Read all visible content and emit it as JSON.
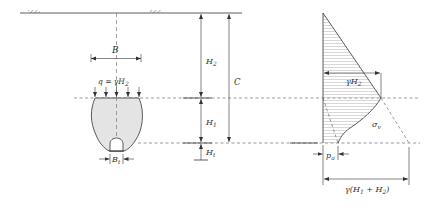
{
  "figure": {
    "type": "tunnel-collapse-arch-pressure-diagram",
    "colors": {
      "line": "#333333",
      "fill_collapse_zone": "#e4e4e4",
      "hatch": "#bdbdbd",
      "dashed": "#555555"
    }
  },
  "left": {
    "width_label": "B",
    "load_label": "q = γH",
    "load_label_sub": "2",
    "tunnel_width_label": "B",
    "tunnel_width_sub": "t"
  },
  "middle": {
    "h2_label": "H",
    "h2_sub": "2",
    "h1_label": "H",
    "h1_sub": "1",
    "ht_label": "H",
    "ht_sub": "t",
    "c_label": "C"
  },
  "right": {
    "gamma_h2_label": "γH",
    "gamma_h2_sub": "2",
    "sigma_label": "σ",
    "sigma_sub": "v",
    "pa_label": "p",
    "pa_sub": "a",
    "total_label_pre": "γ(H",
    "total_label_sub1": "1",
    "total_label_mid": " + H",
    "total_label_sub2": "2",
    "total_label_post": ")"
  }
}
